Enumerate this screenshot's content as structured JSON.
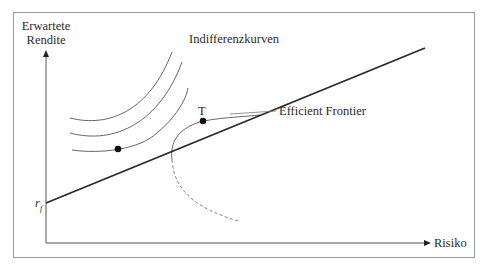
{
  "diagram": {
    "title": "",
    "y_axis_label_line1": "Erwartete",
    "y_axis_label_line2": "Rendite",
    "x_axis_label": "Risiko",
    "rf_label": "r",
    "rf_subscript": "f",
    "indifference_label": "Indifferenzkurven",
    "tangent_point_label": "T",
    "frontier_label": "Efficient Frontier",
    "colors": {
      "frame": "#9a9a9a",
      "axes": "#555555",
      "capital_market_line": "#2a2a2a",
      "curves": "#555555",
      "dashed": "#777777",
      "points": "#111111"
    }
  }
}
